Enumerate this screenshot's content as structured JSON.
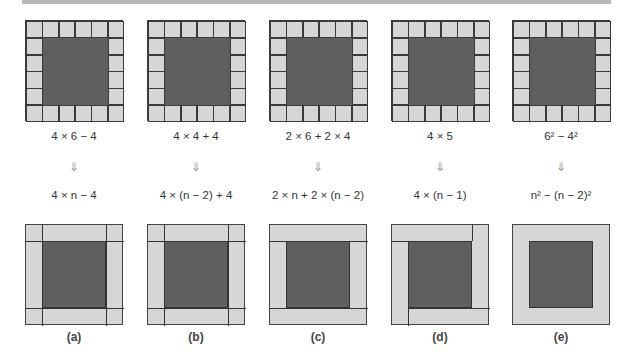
{
  "figure": {
    "grid_size": 6,
    "panels": [
      {
        "id": "a",
        "label": "(a)",
        "numeric": "4 × 6 − 4",
        "arrow": "⇓",
        "general": "4 × n − 4"
      },
      {
        "id": "b",
        "label": "(b)",
        "numeric": "4 × 4 + 4",
        "arrow": "⇓",
        "general": "4 × (n − 2) + 4"
      },
      {
        "id": "c",
        "label": "(c)",
        "numeric": "2 × 6 + 2 × 4",
        "arrow": "⇓",
        "general": "2 × n + 2 × (n − 2)"
      },
      {
        "id": "d",
        "label": "(d)",
        "numeric": "4 × 5",
        "arrow": "⇓",
        "general": "4 × (n − 1)"
      },
      {
        "id": "e",
        "label": "(e)",
        "numeric": "6² − 4²",
        "arrow": "⇓",
        "general": "n² − (n − 2)²"
      }
    ]
  },
  "colors": {
    "border_cell": "#d6d6d6",
    "interior": "#5f5f5f",
    "line": "#333333",
    "bar": "#b9b9b9"
  }
}
